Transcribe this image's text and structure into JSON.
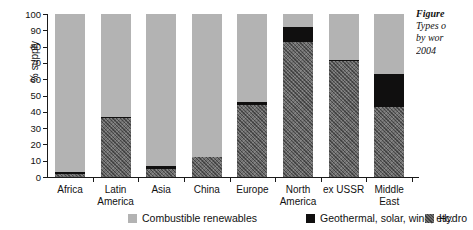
{
  "chart_data": {
    "type": "bar",
    "stacked": true,
    "title": "",
    "xlabel": "",
    "ylabel": "% supply",
    "ylim": [
      0,
      100
    ],
    "yticks": [
      0,
      10,
      20,
      30,
      40,
      50,
      60,
      70,
      80,
      90,
      100
    ],
    "grid": false,
    "legend_position": "bottom",
    "categories": [
      "Africa",
      "Latin\nAmerica",
      "Asia",
      "China",
      "Europe",
      "North\nAmerica",
      "ex USSR",
      "Middle\nEast"
    ],
    "series": [
      {
        "name": "Hydro",
        "values": [
          2,
          36,
          5,
          12,
          44,
          83,
          71,
          43
        ]
      },
      {
        "name": "Geothermal, solar, wind, etc.",
        "values": [
          1,
          1,
          2,
          0,
          2,
          9,
          1,
          20
        ]
      },
      {
        "name": "Combustible renewables",
        "values": [
          97,
          63,
          93,
          88,
          54,
          8,
          28,
          37
        ]
      }
    ],
    "colors": {
      "combustible": "#b3b3b3",
      "geothermal": "#100f0f",
      "hydro": "#6e6e6e"
    }
  },
  "legend": {
    "items": [
      {
        "label": "Combustible renewables",
        "swatch": "combustible"
      },
      {
        "label": "Geothermal, solar, wind, etc.",
        "swatch": "geothermal"
      },
      {
        "label": "Hydro",
        "swatch": "hydro"
      }
    ]
  },
  "caption": {
    "title": "Figure",
    "body": "Types o\nby wor\n2004"
  }
}
